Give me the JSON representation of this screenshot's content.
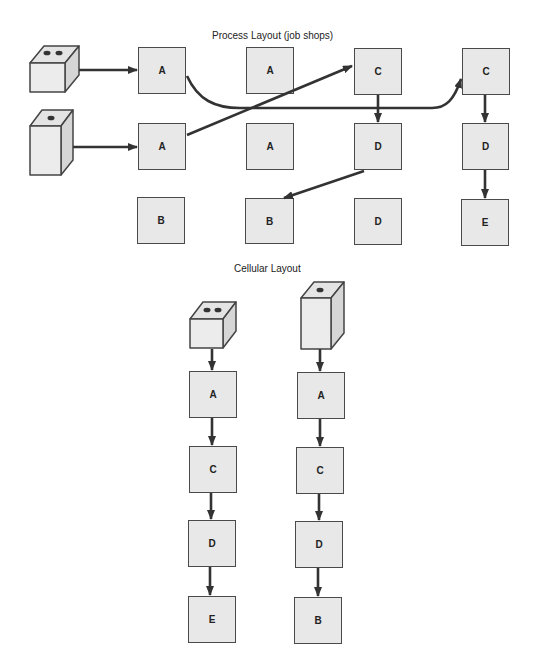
{
  "process_layout": {
    "title": "Process Layout (job shops)",
    "machines": [
      {
        "id": "p-a1",
        "label": "A",
        "x": 138,
        "y": 47
      },
      {
        "id": "p-a2",
        "label": "A",
        "x": 246,
        "y": 47
      },
      {
        "id": "p-c1",
        "label": "C",
        "x": 354,
        "y": 48
      },
      {
        "id": "p-c2",
        "label": "C",
        "x": 462,
        "y": 48
      },
      {
        "id": "p-a3",
        "label": "A",
        "x": 138,
        "y": 123
      },
      {
        "id": "p-a4",
        "label": "A",
        "x": 246,
        "y": 123
      },
      {
        "id": "p-d1",
        "label": "D",
        "x": 354,
        "y": 123
      },
      {
        "id": "p-d2",
        "label": "D",
        "x": 462,
        "y": 123
      },
      {
        "id": "p-b1",
        "label": "B",
        "x": 137,
        "y": 197
      },
      {
        "id": "p-b2",
        "label": "B",
        "x": 245,
        "y": 198
      },
      {
        "id": "p-d3",
        "label": "D",
        "x": 354,
        "y": 198
      },
      {
        "id": "p-e1",
        "label": "E",
        "x": 461,
        "y": 199
      }
    ],
    "parts": [
      {
        "id": "part-two-dot",
        "description": "cube part with two holes"
      },
      {
        "id": "part-one-dot",
        "description": "tall block part with one hole"
      }
    ],
    "routes": [
      {
        "part": "part-two-dot",
        "sequence": [
          "A",
          "C",
          "D",
          "E"
        ]
      },
      {
        "part": "part-one-dot",
        "sequence": [
          "A",
          "C",
          "D",
          "B"
        ]
      }
    ]
  },
  "cellular_layout": {
    "title": "Cellular Layout",
    "cells": [
      {
        "part": "part-two-dot",
        "machines": [
          "A",
          "C",
          "D",
          "E"
        ]
      },
      {
        "part": "part-one-dot",
        "machines": [
          "A",
          "C",
          "D",
          "B"
        ]
      }
    ]
  }
}
